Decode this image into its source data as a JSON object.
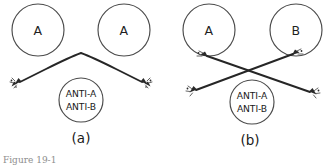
{
  "figure": {
    "background_color": "#ffffff",
    "stroke_color": "#4a4a4a",
    "line_color": "#262626",
    "caption_partial": "Figure 19-1",
    "panels": [
      {
        "id": "a",
        "label": "(a)",
        "reaction": "no-crossing-chevron",
        "cells": [
          {
            "label": "A",
            "position": "left"
          },
          {
            "label": "A",
            "position": "right"
          }
        ],
        "serum": {
          "line_1": "ANTI-A",
          "line_2": "ANTI-B"
        }
      },
      {
        "id": "b",
        "label": "(b)",
        "reaction": "crossed-x",
        "cells": [
          {
            "label": "A",
            "position": "left"
          },
          {
            "label": "B",
            "position": "right"
          }
        ],
        "serum": {
          "line_1": "ANTI-A",
          "line_2": "ANTI-B"
        }
      }
    ]
  }
}
